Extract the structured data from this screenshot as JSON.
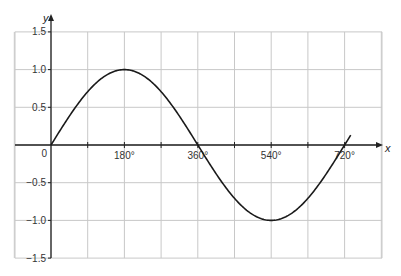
{
  "chart_data": {
    "type": "line",
    "title": "",
    "xlabel": "x",
    "ylabel": "y",
    "xlim": [
      0,
      720
    ],
    "ylim": [
      -1.5,
      1.5
    ],
    "grid": true,
    "x_ticks": [
      {
        "value": 0,
        "label": "0"
      },
      {
        "value": 180,
        "label": "180°"
      },
      {
        "value": 360,
        "label": "360°"
      },
      {
        "value": 540,
        "label": "540°"
      },
      {
        "value": 720,
        "label": "720°"
      }
    ],
    "y_ticks": [
      {
        "value": 1.5,
        "label": "1.5"
      },
      {
        "value": 1.0,
        "label": "1.0"
      },
      {
        "value": 0.5,
        "label": "0.5"
      },
      {
        "value": -0.5,
        "label": "−0.5"
      },
      {
        "value": -1.0,
        "label": "−1.0"
      },
      {
        "value": -1.5,
        "label": "−1.5"
      }
    ],
    "series": [
      {
        "name": "y = sin(x/2)",
        "function": "sin(x/2)",
        "x": [
          0,
          90,
          180,
          270,
          360,
          450,
          540,
          630,
          720,
          735
        ],
        "values": [
          0,
          0.71,
          1.0,
          0.71,
          0,
          -0.71,
          -1.0,
          -0.71,
          0,
          0.2
        ]
      }
    ],
    "legend": null
  },
  "labels": {
    "y_axis": "y",
    "x_axis": "x",
    "origin": "0"
  }
}
